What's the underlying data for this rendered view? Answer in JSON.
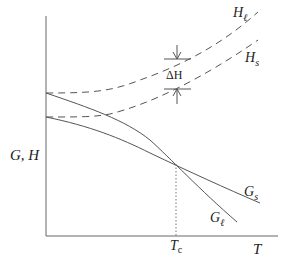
{
  "diagram": {
    "axes": {
      "y_label": "G, H",
      "x_label": "T"
    },
    "curves": {
      "H_liquid": {
        "label_main": "H",
        "label_sub": "ℓ",
        "style": "dashed"
      },
      "H_solid": {
        "label_main": "H",
        "label_sub": "s",
        "style": "dashed"
      },
      "G_solid": {
        "label_main": "G",
        "label_sub": "s",
        "style": "solid"
      },
      "G_liquid": {
        "label_main": "G",
        "label_sub": "ℓ",
        "style": "solid"
      }
    },
    "annotations": {
      "delta_h": "ΔH",
      "tc_main": "T",
      "tc_sub": "c"
    },
    "colors": {
      "line": "#555555",
      "text": "#222222",
      "background": "#ffffff"
    }
  }
}
